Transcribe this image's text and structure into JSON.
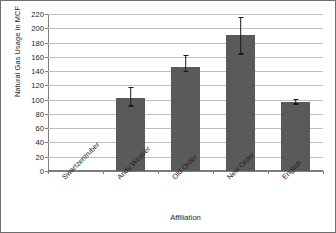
{
  "chart_data": {
    "type": "bar",
    "title": "",
    "xlabel": "Affiliation",
    "ylabel": "Natural Gas Usage in MCF",
    "categories": [
      "Swartzentruber",
      "Andy Weaver",
      "Old Order",
      "New Order",
      "English"
    ],
    "values": [
      0,
      103,
      146,
      190,
      97
    ],
    "errors_upper": [
      0,
      118,
      163,
      216,
      101
    ],
    "errors_lower": [
      0,
      92,
      140,
      165,
      95
    ],
    "ylim": [
      0,
      220
    ],
    "ytick_step": 20,
    "yticks": [
      "0",
      "20",
      "40",
      "60",
      "80",
      "100",
      "120",
      "140",
      "160",
      "180",
      "200",
      "220"
    ],
    "grid": true,
    "legend": false,
    "bar_color": "#5a5a5a",
    "error_color": "#1a1a1a",
    "grid_color": "#bfbfbf",
    "axis_color": "#7d7d7d",
    "background": "#ffffff"
  }
}
